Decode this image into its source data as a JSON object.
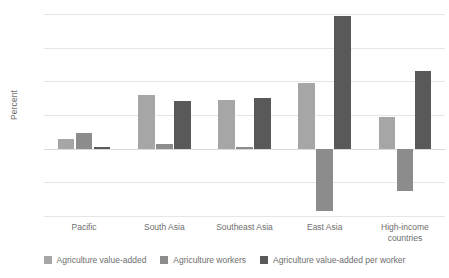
{
  "chart_data": {
    "type": "bar",
    "title": "",
    "xlabel": "",
    "ylabel": "Percent",
    "ylim": [
      -4,
      8
    ],
    "ytick_step": 2,
    "yticks": [
      8,
      6,
      4,
      2,
      0,
      -2,
      -4
    ],
    "ytick_labels": [
      "8",
      "6",
      "4",
      "2",
      "0",
      "-2",
      "-4"
    ],
    "grid": true,
    "legend_position": "bottom",
    "categories": [
      "Pacific",
      "South Asia",
      "Southeast Asia",
      "East Asia",
      "High-income countries"
    ],
    "series": [
      {
        "name": "Agriculture value-added",
        "color": "#a6a6a6",
        "values": [
          0.55,
          3.2,
          2.9,
          3.9,
          1.9
        ]
      },
      {
        "name": "Agriculture workers",
        "color": "#8c8c8c",
        "values": [
          0.95,
          0.25,
          0.1,
          -3.7,
          -2.5
        ]
      },
      {
        "name": "Agriculture value-added per worker",
        "color": "#595959",
        "values": [
          0.07,
          2.85,
          3.0,
          7.9,
          4.6
        ]
      }
    ]
  },
  "colors": {
    "series_1": "#a6a6a6",
    "series_2": "#8c8c8c",
    "series_3": "#595959",
    "gridline": "#e6e6e6",
    "zero_line": "#d9d9d9",
    "text": "#6e6e6e",
    "background": "#ffffff"
  }
}
